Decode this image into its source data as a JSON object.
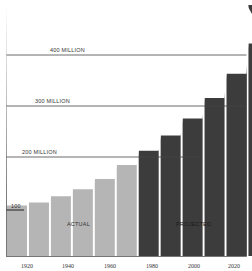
{
  "chart_data": {
    "type": "bar",
    "title": "",
    "xlabel": "",
    "ylabel": "",
    "ylim": [
      0,
      490
    ],
    "grid": true,
    "categories": [
      "1910",
      "1920",
      "1930",
      "1940",
      "1950",
      "1960",
      "1970",
      "1980",
      "1990",
      "2000",
      "2010",
      "2020"
    ],
    "series": [
      {
        "name": "Actual",
        "color": "#b5b5b5",
        "values": [
          100,
          106,
          118,
          132,
          152,
          180,
          null,
          null,
          null,
          null,
          null,
          null
        ]
      },
      {
        "name": "Projected",
        "color": "#3c3c3c",
        "values": [
          null,
          null,
          null,
          null,
          null,
          null,
          208,
          238,
          272,
          312,
          360,
          420
        ]
      }
    ],
    "gridlines": [
      {
        "value": 400,
        "label": "400 MILLION"
      },
      {
        "value": 300,
        "label": "300 MILLION"
      },
      {
        "value": 200,
        "label": "200 MILLION"
      }
    ],
    "reference_marker": {
      "value": 100,
      "label": "100"
    },
    "x_tick_labels": [
      "1920",
      "1940",
      "1960",
      "1980",
      "2000",
      "2020"
    ],
    "annotations": [
      "ACTUAL",
      "PROJECTED"
    ]
  },
  "labels": {
    "grid400": "400 MILLION",
    "grid300": "300 MILLION",
    "grid200": "200 MILLION",
    "marker100": "100",
    "actual": "ACTUAL",
    "projected": "PROJECTED"
  },
  "ticks": [
    "1920",
    "1940",
    "1960",
    "1980",
    "2000",
    "2020"
  ]
}
